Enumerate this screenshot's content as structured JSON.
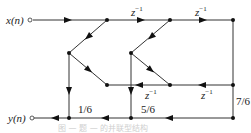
{
  "diagram": {
    "type": "signal-flow-graph",
    "input_label": "x(n)",
    "output_label": "y(n)",
    "delay_labels": {
      "top_1": "z",
      "top_2": "z",
      "mid_1": "z",
      "mid_2": "z",
      "exponent": "−1"
    },
    "gains": {
      "g1": "1/6",
      "g2": "5/6",
      "g3": "7/6"
    },
    "caption": "图 — 题 — 的并联型结构",
    "colors": {
      "line": "#333333",
      "node": "#111111",
      "caption": "#cfcfcf"
    }
  }
}
